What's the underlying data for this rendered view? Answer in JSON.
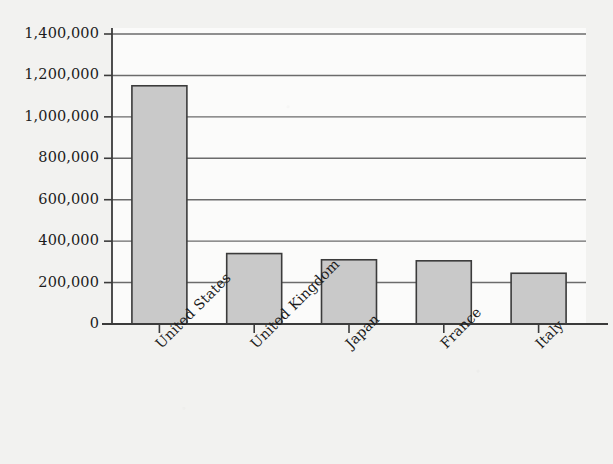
{
  "chart_data": {
    "type": "bar",
    "title": "",
    "subtitle": "",
    "xlabel": "",
    "ylabel": "",
    "categories": [
      "United States",
      "United Kingdom",
      "Japan",
      "France",
      "Italy"
    ],
    "values": [
      1150000,
      340000,
      310000,
      305000,
      245000
    ],
    "ylim": [
      0,
      1400000
    ],
    "ytick_values": [
      0,
      200000,
      400000,
      600000,
      800000,
      1000000,
      1200000,
      1400000
    ],
    "ytick_labels": [
      "0",
      "200,000",
      "400,000",
      "600,000",
      "800,000",
      "1,000,000",
      "1,200,000",
      "1,400,000"
    ],
    "grid": true,
    "grid_axis": "y",
    "legend": null,
    "legend_position": "none",
    "xtick_label_rotation": -45,
    "bar_fill_color": "#c9c9c9",
    "bar_border_color": "#3b3b3b",
    "axis_color": "#3b3b3b",
    "grid_color": "#6b6b6b",
    "background_color": "#f2f2f0",
    "plot_background_color": "#fbfbfa",
    "text_color": "#1c1c1c"
  }
}
